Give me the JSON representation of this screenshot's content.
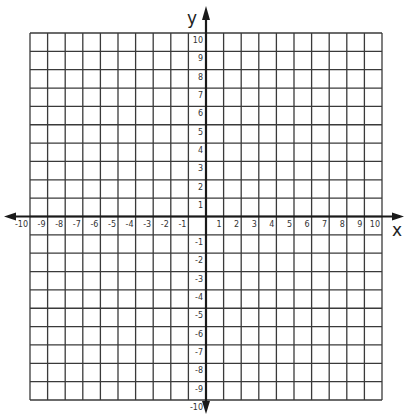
{
  "diagram": {
    "type": "coordinate-plane",
    "axes": {
      "x": {
        "label": "x",
        "min": -10,
        "max": 10,
        "step": 1
      },
      "y": {
        "label": "y",
        "min": -10,
        "max": 10,
        "step": 1
      }
    },
    "x_ticks": [
      "-10",
      "-9",
      "-8",
      "-7",
      "-6",
      "-5",
      "-4",
      "-3",
      "-2",
      "-1",
      "1",
      "2",
      "3",
      "4",
      "5",
      "6",
      "7",
      "8",
      "9",
      "10"
    ],
    "y_ticks": [
      "10",
      "9",
      "8",
      "7",
      "6",
      "5",
      "4",
      "3",
      "2",
      "1",
      "-1",
      "-2",
      "-3",
      "-4",
      "-5",
      "-6",
      "-7",
      "-8",
      "-9",
      "-10"
    ],
    "grid": {
      "cells_x": 20,
      "cells_y": 20,
      "line_color": "#3a3a3a",
      "axis_color": "#1a1a1a"
    }
  },
  "chart_data": {
    "type": "grid",
    "title": "",
    "xlabel": "x",
    "ylabel": "y",
    "xlim": [
      -10,
      10
    ],
    "ylim": [
      -10,
      10
    ],
    "grid": true,
    "x_tick_labels": [
      -10,
      -9,
      -8,
      -7,
      -6,
      -5,
      -4,
      -3,
      -2,
      -1,
      1,
      2,
      3,
      4,
      5,
      6,
      7,
      8,
      9,
      10
    ],
    "y_tick_labels": [
      10,
      9,
      8,
      7,
      6,
      5,
      4,
      3,
      2,
      1,
      -1,
      -2,
      -3,
      -4,
      -5,
      -6,
      -7,
      -8,
      -9,
      -10
    ],
    "series": []
  }
}
